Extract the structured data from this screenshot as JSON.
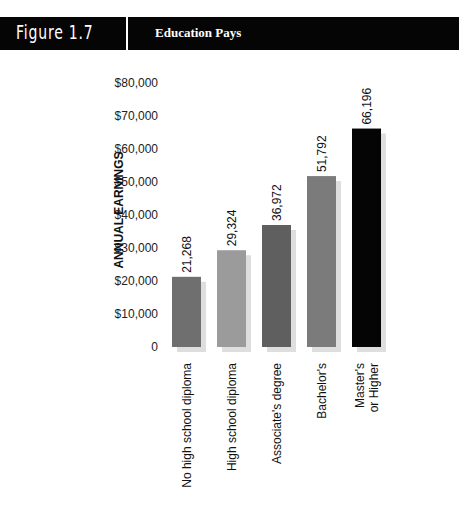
{
  "header": {
    "figure_number": "Figure 1.7",
    "title": "Education Pays"
  },
  "chart_data": {
    "type": "bar",
    "title": "Education Pays",
    "xlabel": "",
    "ylabel": "ANNUAL EARNINGS",
    "ylim": [
      0,
      80000
    ],
    "yticks": [
      0,
      10000,
      20000,
      30000,
      40000,
      50000,
      60000,
      70000,
      80000
    ],
    "ytick_labels": [
      "0",
      "$10,000",
      "$20,000",
      "$30,000",
      "$40,000",
      "$50,000",
      "$60,000",
      "$70,000",
      "$80,000"
    ],
    "grid": false,
    "categories": [
      [
        "No high school diploma"
      ],
      [
        "High school diploma"
      ],
      [
        "Associate's degree"
      ],
      [
        "Bachelor's"
      ],
      [
        "Master's",
        "or Higher"
      ]
    ],
    "values": [
      21268,
      29324,
      36972,
      51792,
      66196
    ],
    "data_labels": [
      "21,268",
      "29,324",
      "36,972",
      "51,792",
      "66,196"
    ],
    "colors": [
      "#6f6f6f",
      "#9b9b9b",
      "#5f5f5f",
      "#7b7b7b",
      "#050505"
    ],
    "shadow_color": "#dedede"
  }
}
